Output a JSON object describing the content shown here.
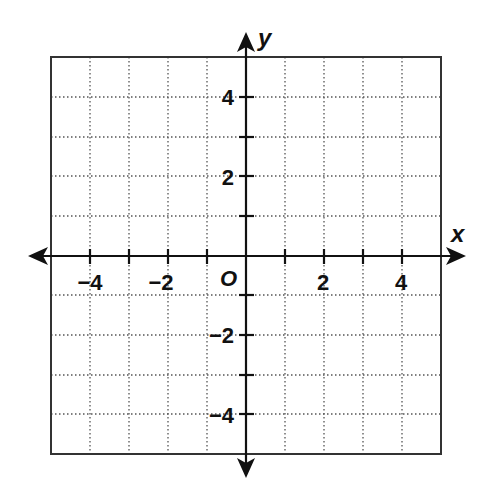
{
  "diagram": {
    "type": "coordinate-plane",
    "x_axis": {
      "name": "x",
      "range": [
        -5,
        5
      ],
      "tick_step": 1,
      "labeled_ticks": [
        {
          "value": -4,
          "label": "−4"
        },
        {
          "value": -2,
          "label": "−2"
        },
        {
          "value": 2,
          "label": "2"
        },
        {
          "value": 4,
          "label": "4"
        }
      ]
    },
    "y_axis": {
      "name": "y",
      "range": [
        -5,
        5
      ],
      "tick_step": 1,
      "labeled_ticks": [
        {
          "value": 4,
          "label": "4"
        },
        {
          "value": 2,
          "label": "2"
        },
        {
          "value": -2,
          "label": "−2"
        },
        {
          "value": -4,
          "label": "−4"
        }
      ]
    },
    "origin_label": "O",
    "grid": {
      "style": "dotted",
      "cells_x": 10,
      "cells_y": 10
    },
    "colors": {
      "ink": "#111111",
      "grid": "#555555",
      "border": "#333333",
      "background": "#ffffff"
    }
  }
}
